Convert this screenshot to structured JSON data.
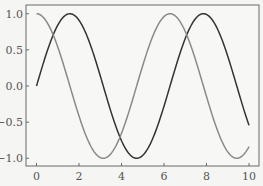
{
  "chart_data": {
    "type": "line",
    "title": "",
    "xlabel": "",
    "ylabel": "",
    "xlim": [
      -0.5,
      10.5
    ],
    "ylim": [
      -1.1,
      1.1
    ],
    "grid": false,
    "legend": null,
    "x_ticks": [
      0,
      2,
      4,
      6,
      8,
      10
    ],
    "x_tick_labels": [
      "0",
      "2",
      "4",
      "6",
      "8",
      "10"
    ],
    "y_ticks": [
      1.0,
      0.5,
      0.0,
      -0.5,
      -1.0
    ],
    "y_tick_labels": [
      "1.0",
      "0.5",
      "0.0",
      "-0.5",
      "-1.0"
    ],
    "x": [
      0,
      0.5,
      1,
      1.5,
      2,
      2.5,
      3,
      3.5,
      4,
      4.5,
      5,
      5.5,
      6,
      6.5,
      7,
      7.5,
      8,
      8.5,
      9,
      9.5,
      10
    ],
    "series": [
      {
        "name": "sin(x)",
        "color": "#333333",
        "values": [
          0.0,
          0.479,
          0.841,
          0.997,
          0.909,
          0.598,
          0.141,
          -0.351,
          -0.757,
          -0.978,
          -0.959,
          -0.706,
          -0.279,
          0.215,
          0.657,
          0.938,
          0.989,
          0.798,
          0.412,
          -0.075,
          -0.544
        ]
      },
      {
        "name": "cos(x)",
        "color": "#8a8a8a",
        "values": [
          1.0,
          0.878,
          0.54,
          0.071,
          -0.416,
          -0.801,
          -0.99,
          -0.936,
          -0.654,
          -0.211,
          0.284,
          0.709,
          0.96,
          0.977,
          0.754,
          0.347,
          -0.146,
          -0.602,
          -0.911,
          -0.997,
          -0.839
        ]
      }
    ]
  },
  "style": {
    "background": "#f5f5f4",
    "axes_face": "#f7f7f6",
    "frame_color": "#6a6a6a",
    "tick_color": "#6a6a6a",
    "label_color": "#555555"
  }
}
